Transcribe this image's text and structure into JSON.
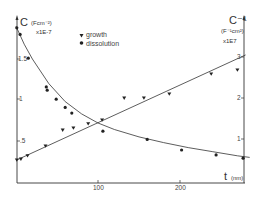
{
  "chart_data": {
    "type": "scatter",
    "title": "",
    "xlabel": "t (nm)",
    "ylabel_left": "C (Fcm⁻²) x1E-7",
    "ylabel_right": "C⁻¹ (F⁻¹cm²) x1E7",
    "xlim": [
      0,
      290
    ],
    "ylim_left": [
      0,
      2.0
    ],
    "ylim_right": [
      0,
      3.5
    ],
    "x_ticks": [
      100,
      200
    ],
    "y_ticks_left": [
      ".5",
      "1",
      "1.5"
    ],
    "y_ticks_right": [
      "1",
      "2",
      "3"
    ],
    "grid": false,
    "legend_position": "upper-center",
    "series": [
      {
        "name": "growth",
        "marker": "triangle-down",
        "axis": "right",
        "fit": "linear",
        "x": [
          1,
          6,
          14,
          36,
          57,
          70,
          88,
          105,
          132,
          156,
          187,
          238,
          270
        ],
        "y": [
          0.49,
          0.51,
          0.59,
          0.83,
          1.07,
          1.17,
          1.37,
          1.56,
          1.85,
          2.0,
          2.22,
          2.44,
          2.83
        ]
      },
      {
        "name": "dissolution",
        "marker": "circle",
        "axis": "left",
        "fit": "decay",
        "x": [
          1,
          5,
          15,
          37,
          38,
          49,
          60,
          68,
          106,
          160,
          202,
          244,
          277
        ],
        "y": [
          1.88,
          1.8,
          1.51,
          1.16,
          1.12,
          1.01,
          0.91,
          0.84,
          0.62,
          0.52,
          0.39,
          0.33,
          0.29
        ]
      }
    ],
    "fit_lines": {
      "growth_line": {
        "x": [
          0,
          280
        ],
        "y": [
          0.48,
          3.05
        ]
      },
      "dissolution_curve": {
        "x": [
          0,
          10,
          20,
          40,
          60,
          80,
          100,
          120,
          150,
          180,
          210,
          240,
          270,
          285
        ],
        "y": [
          1.9,
          1.68,
          1.5,
          1.2,
          0.98,
          0.83,
          0.72,
          0.64,
          0.55,
          0.48,
          0.42,
          0.37,
          0.32,
          0.3
        ]
      }
    }
  },
  "labels": {
    "left_axis_symbol": "C",
    "left_axis_units": "(Fcm⁻²)",
    "left_axis_scale": "x1E-7",
    "right_axis_symbol": "C⁻¹",
    "right_axis_units": "(F⁻¹cm²)",
    "right_axis_scale": "x1E7",
    "x_axis_symbol": "t",
    "x_axis_units": "(nm)",
    "legend_growth": "growth",
    "legend_dissolution": "dissolution",
    "tick_x_100": "100",
    "tick_x_200": "200",
    "tick_left_05": ".5",
    "tick_left_1": "1",
    "tick_left_15": "1.5",
    "tick_right_1": "1",
    "tick_right_2": "2",
    "tick_right_3": "3"
  },
  "colors": {
    "ink": "#2a2a2a",
    "background": "#ffffff"
  }
}
